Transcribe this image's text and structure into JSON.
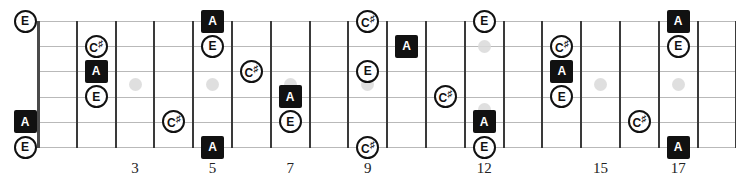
{
  "diagram": {
    "type": "guitar-fretboard",
    "string_count": 6,
    "fret_count": 18,
    "colors": {
      "root_fill": "#111111",
      "root_text": "#ffffff",
      "tone_fill": "#ffffff",
      "tone_text": "#111111",
      "string": "#b9b9b9",
      "fret": "#3a3a3a",
      "inlay": "#d9d9d9",
      "background": "#ffffff"
    },
    "geometry": {
      "nut_x": 38,
      "fret_spacing": 38.8,
      "board_top": 21,
      "string_spacing": 25.2,
      "fret_line_top": 21,
      "fret_line_height": 127
    }
  },
  "fret_numbers": [
    {
      "label": "3",
      "fret": 3
    },
    {
      "label": "5",
      "fret": 5
    },
    {
      "label": "7",
      "fret": 7
    },
    {
      "label": "9",
      "fret": 9
    },
    {
      "label": "12",
      "fret": 12
    },
    {
      "label": "15",
      "fret": 15
    },
    {
      "label": "17",
      "fret": 17
    }
  ],
  "inlays": [
    {
      "fret": 3,
      "string": 3.5
    },
    {
      "fret": 5,
      "string": 3.5
    },
    {
      "fret": 7,
      "string": 3.5
    },
    {
      "fret": 9,
      "string": 3.5
    },
    {
      "fret": 12,
      "string": 2.0
    },
    {
      "fret": 12,
      "string": 4.5
    },
    {
      "fret": 15,
      "string": 3.5
    },
    {
      "fret": 17,
      "string": 3.5
    }
  ],
  "notes": [
    {
      "label": "E",
      "kind": "tone",
      "string": 1,
      "fret": 0,
      "sharp": false
    },
    {
      "label": "A",
      "kind": "root",
      "string": 5,
      "fret": 0,
      "sharp": false
    },
    {
      "label": "E",
      "kind": "tone",
      "string": 6,
      "fret": 0,
      "sharp": false
    },
    {
      "label": "C",
      "kind": "tone",
      "string": 2,
      "fret": 2,
      "sharp": true
    },
    {
      "label": "A",
      "kind": "root",
      "string": 3,
      "fret": 2,
      "sharp": false
    },
    {
      "label": "E",
      "kind": "tone",
      "string": 4,
      "fret": 2,
      "sharp": false
    },
    {
      "label": "C",
      "kind": "tone",
      "string": 5,
      "fret": 4,
      "sharp": true
    },
    {
      "label": "A",
      "kind": "root",
      "string": 1,
      "fret": 5,
      "sharp": false
    },
    {
      "label": "E",
      "kind": "tone",
      "string": 2,
      "fret": 5,
      "sharp": false
    },
    {
      "label": "A",
      "kind": "root",
      "string": 6,
      "fret": 5,
      "sharp": false
    },
    {
      "label": "C",
      "kind": "tone",
      "string": 3,
      "fret": 6,
      "sharp": true
    },
    {
      "label": "A",
      "kind": "root",
      "string": 4,
      "fret": 7,
      "sharp": false
    },
    {
      "label": "E",
      "kind": "tone",
      "string": 5,
      "fret": 7,
      "sharp": false
    },
    {
      "label": "C",
      "kind": "tone",
      "string": 1,
      "fret": 9,
      "sharp": true
    },
    {
      "label": "E",
      "kind": "tone",
      "string": 3,
      "fret": 9,
      "sharp": false
    },
    {
      "label": "C",
      "kind": "tone",
      "string": 6,
      "fret": 9,
      "sharp": true
    },
    {
      "label": "A",
      "kind": "root",
      "string": 2,
      "fret": 10,
      "sharp": false
    },
    {
      "label": "C",
      "kind": "tone",
      "string": 4,
      "fret": 11,
      "sharp": true
    },
    {
      "label": "E",
      "kind": "tone",
      "string": 1,
      "fret": 12,
      "sharp": false
    },
    {
      "label": "A",
      "kind": "root",
      "string": 5,
      "fret": 12,
      "sharp": false
    },
    {
      "label": "E",
      "kind": "tone",
      "string": 6,
      "fret": 12,
      "sharp": false
    },
    {
      "label": "C",
      "kind": "tone",
      "string": 2,
      "fret": 14,
      "sharp": true
    },
    {
      "label": "A",
      "kind": "root",
      "string": 3,
      "fret": 14,
      "sharp": false
    },
    {
      "label": "E",
      "kind": "tone",
      "string": 4,
      "fret": 14,
      "sharp": false
    },
    {
      "label": "C",
      "kind": "tone",
      "string": 5,
      "fret": 16,
      "sharp": true
    },
    {
      "label": "A",
      "kind": "root",
      "string": 1,
      "fret": 17,
      "sharp": false
    },
    {
      "label": "E",
      "kind": "tone",
      "string": 2,
      "fret": 17,
      "sharp": false
    },
    {
      "label": "A",
      "kind": "root",
      "string": 6,
      "fret": 17,
      "sharp": false
    }
  ]
}
